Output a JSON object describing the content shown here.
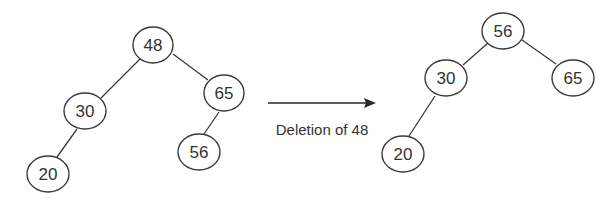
{
  "diagram": {
    "before_tree": {
      "nodes": [
        {
          "id": "b48",
          "label": "48",
          "cx": 153,
          "cy": 45
        },
        {
          "id": "b30",
          "label": "30",
          "cx": 85,
          "cy": 111
        },
        {
          "id": "b65",
          "label": "65",
          "cx": 224,
          "cy": 93
        },
        {
          "id": "b20",
          "label": "20",
          "cx": 48,
          "cy": 174
        },
        {
          "id": "b56",
          "label": "56",
          "cx": 199,
          "cy": 152
        }
      ],
      "edges": [
        {
          "from": "b48",
          "to": "b30"
        },
        {
          "from": "b48",
          "to": "b65"
        },
        {
          "from": "b30",
          "to": "b20"
        },
        {
          "from": "b65",
          "to": "b56"
        }
      ]
    },
    "transition": {
      "label": "Deletion of 48"
    },
    "after_tree": {
      "nodes": [
        {
          "id": "a56",
          "label": "56",
          "cx": 503,
          "cy": 31
        },
        {
          "id": "a30",
          "label": "30",
          "cx": 446,
          "cy": 78
        },
        {
          "id": "a65",
          "label": "65",
          "cx": 573,
          "cy": 78
        },
        {
          "id": "a20",
          "label": "20",
          "cx": 403,
          "cy": 154
        }
      ],
      "edges": [
        {
          "from": "a56",
          "to": "a30"
        },
        {
          "from": "a56",
          "to": "a65"
        },
        {
          "from": "a30",
          "to": "a20"
        }
      ]
    },
    "colors": {
      "stroke": "#3a3a3a",
      "text": "#333333",
      "background": "#ffffff"
    }
  }
}
